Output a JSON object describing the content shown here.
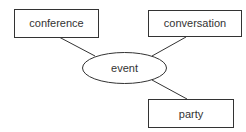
{
  "diagram": {
    "type": "concept-map",
    "center": {
      "id": "event",
      "label": "event",
      "shape": "ellipse"
    },
    "nodes": [
      {
        "id": "conference",
        "label": "conference",
        "shape": "rectangle"
      },
      {
        "id": "conversation",
        "label": "conversation",
        "shape": "rectangle"
      },
      {
        "id": "party",
        "label": "party",
        "shape": "rectangle"
      }
    ],
    "edges": [
      {
        "from": "event",
        "to": "conference"
      },
      {
        "from": "event",
        "to": "conversation"
      },
      {
        "from": "event",
        "to": "party"
      }
    ],
    "colors": {
      "stroke": "#333333",
      "background": "#ffffff",
      "text": "#333333"
    }
  }
}
